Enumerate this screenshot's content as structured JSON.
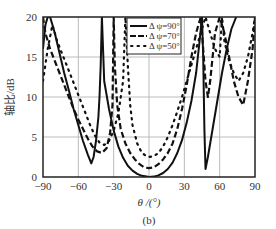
{
  "chart_data": {
    "type": "line",
    "title": "",
    "subtitle": "(b)",
    "xlabel": "θ /(°)",
    "ylabel": "轴比/dB",
    "xlim": [
      -90,
      90
    ],
    "ylim": [
      0,
      20
    ],
    "xticks": [
      -90,
      -60,
      -30,
      0,
      30,
      60,
      90
    ],
    "xtick_labels": [
      "−90",
      "−60",
      "−30",
      "0",
      "30",
      "60",
      "90"
    ],
    "yticks": [
      0,
      5,
      10,
      15,
      20
    ],
    "ytick_labels": [
      "0",
      "5",
      "10",
      "15",
      "20"
    ],
    "grid": true,
    "legend_position": "upper-right-inside",
    "series": [
      {
        "name": "Δ ψ=90°",
        "style": "solid",
        "x": [
          -90,
          -88,
          -86,
          -84,
          -80,
          -76,
          -72,
          -68,
          -64,
          -60,
          -56,
          -52,
          -49,
          -47,
          -45,
          -43,
          -42,
          -41,
          -40,
          -38,
          -34,
          -30,
          -26,
          -22,
          -18,
          -14,
          -10,
          -6,
          -2,
          0,
          4,
          8,
          12,
          16,
          20,
          24,
          28,
          32,
          36,
          40,
          43,
          45,
          46,
          47,
          48,
          50,
          54,
          58,
          62,
          66,
          70,
          74
        ],
        "y": [
          16,
          19,
          20,
          20,
          18,
          15.5,
          13,
          10.8,
          8.5,
          6.5,
          4.5,
          2.8,
          1.7,
          2.5,
          4.5,
          7.5,
          10,
          14,
          20,
          12,
          8.5,
          5.8,
          3.8,
          2.4,
          1.4,
          0.8,
          0.4,
          0.15,
          0.05,
          0,
          0.05,
          0.2,
          0.5,
          1,
          1.8,
          3,
          4.6,
          6.8,
          9.5,
          13,
          17,
          20,
          15,
          6,
          1,
          2.5,
          6,
          9.5,
          13,
          16,
          18.5,
          20
        ]
      },
      {
        "name": "Δ ψ=70°",
        "style": "dashed",
        "x": [
          -90,
          -88,
          -84,
          -80,
          -76,
          -72,
          -68,
          -64,
          -60,
          -56,
          -52,
          -48,
          -44,
          -40,
          -36,
          -33,
          -31,
          -30,
          -29,
          -27,
          -24,
          -20,
          -16,
          -12,
          -8,
          -4,
          0,
          4,
          8,
          12,
          16,
          20,
          24,
          28,
          32,
          36,
          40,
          44,
          46,
          48,
          50,
          52,
          54,
          56,
          60,
          64,
          68,
          72,
          76,
          80,
          84,
          88,
          90
        ],
        "y": [
          20,
          18,
          16,
          14.5,
          13,
          11.5,
          10,
          8.5,
          7.2,
          6,
          4.8,
          3.8,
          3.2,
          3,
          3.6,
          5.5,
          9,
          20,
          14,
          9,
          6,
          4.2,
          3,
          2.2,
          1.6,
          1.2,
          1.1,
          1.2,
          1.6,
          2.2,
          3,
          4.2,
          6,
          8.5,
          11.5,
          15,
          18,
          20,
          16,
          12,
          10,
          12,
          15,
          18,
          20,
          18,
          15,
          12,
          10,
          9,
          12,
          16,
          20
        ]
      },
      {
        "name": "Δ ψ=50°",
        "style": "dotted",
        "x": [
          -90,
          -86,
          -82,
          -78,
          -74,
          -70,
          -66,
          -62,
          -58,
          -54,
          -50,
          -46,
          -42,
          -38,
          -34,
          -30,
          -26,
          -22,
          -20,
          -18,
          -16,
          -14,
          -10,
          -6,
          -2,
          0,
          4,
          8,
          12,
          16,
          20,
          24,
          28,
          32,
          36,
          40,
          44,
          48,
          52,
          56,
          60,
          62,
          64,
          68,
          72,
          76,
          80,
          84,
          88,
          90
        ],
        "y": [
          12,
          16,
          19,
          17,
          15.5,
          14,
          12.5,
          11,
          9.5,
          8,
          6.5,
          5.2,
          4.3,
          4,
          4.5,
          5.8,
          8,
          12,
          20,
          14,
          9,
          6.5,
          4.2,
          3,
          2.6,
          2.5,
          2.6,
          3,
          3.8,
          5,
          6.5,
          8.2,
          10,
          12,
          14,
          16,
          18,
          20,
          18,
          16,
          15,
          20,
          17,
          14.5,
          13,
          12,
          13,
          15,
          18,
          20
        ]
      }
    ]
  },
  "legend": {
    "items": [
      {
        "label": "Δ ψ=90°",
        "style": "solid"
      },
      {
        "label": "Δ ψ=70°",
        "style": "dashed"
      },
      {
        "label": "Δ ψ=50°",
        "style": "dotted"
      }
    ]
  },
  "axes": {
    "xlabel": "θ /(°)",
    "ylabel": "轴比/dB",
    "caption": "(b)"
  }
}
